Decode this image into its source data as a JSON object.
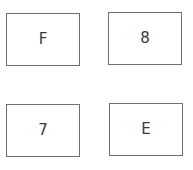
{
  "cards": [
    {
      "label": "F"
    },
    {
      "label": "8"
    },
    {
      "label": "7"
    },
    {
      "label": "E"
    }
  ]
}
